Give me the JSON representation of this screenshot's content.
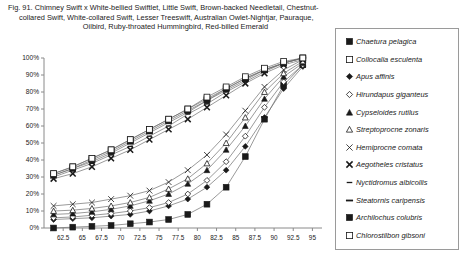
{
  "caption": {
    "line1": "Fig. 91.  Chimney Swift x White-bellied Swiftlet, Little Swift, Brown-backed Needletail, Chestnut-",
    "line2": "collared Swift, White-collared Swift, Lesser Treeswift, Australian Owlet-Nightjar, Pauraque,",
    "line3": "Oilbird, Ruby-throated Hummingbird, Red-billed Emerald"
  },
  "chart_data": {
    "type": "line",
    "xlabel": "",
    "ylabel": "",
    "grid": false,
    "legend_position": "right",
    "xlim": [
      60,
      96.25
    ],
    "ylim": [
      0,
      100
    ],
    "xticks": [
      62.5,
      65,
      67.5,
      70,
      72.5,
      75,
      77.5,
      80,
      82.5,
      85,
      87.5,
      90,
      92.5,
      95
    ],
    "xticklabels": [
      "62.5",
      "65",
      "67.5",
      "70",
      "72.5",
      "75",
      "77.5",
      "80",
      "82.5",
      "85",
      "87.5",
      "90",
      "92.5",
      "95"
    ],
    "yticks": [
      0,
      10,
      20,
      30,
      40,
      50,
      60,
      70,
      80,
      90,
      100
    ],
    "yticklabels": [
      "0%",
      "10%",
      "20%",
      "30%",
      "40%",
      "50%",
      "60%",
      "70%",
      "80%",
      "90%",
      "100%"
    ],
    "x": [
      61.25,
      63.75,
      66.25,
      68.75,
      71.25,
      73.75,
      76.25,
      78.75,
      81.25,
      83.75,
      86.25,
      88.75,
      91.25,
      93.75
    ],
    "series": [
      {
        "name": "Chaetura pelagica",
        "marker": "filled-square",
        "values": [
          0,
          0.5,
          1,
          1.5,
          2.5,
          3.5,
          5,
          8,
          14,
          24,
          42,
          64,
          84,
          96
        ]
      },
      {
        "name": "Collocalia esculenta",
        "marker": "open-square",
        "values": [
          32,
          36,
          41,
          46,
          52,
          58,
          64,
          70,
          76,
          82,
          88,
          93,
          97,
          100
        ]
      },
      {
        "name": "Apus affinis",
        "marker": "filled-diamond",
        "values": [
          5,
          5.5,
          6,
          7,
          8,
          10,
          13,
          17,
          24,
          34,
          48,
          65,
          82,
          95
        ]
      },
      {
        "name": "Hirundapus giganteus",
        "marker": "open-diamond",
        "values": [
          6,
          6.5,
          7.5,
          8.5,
          10,
          12,
          15,
          20,
          28,
          39,
          54,
          71,
          86,
          96
        ]
      },
      {
        "name": "Cypseloides rutilus",
        "marker": "filled-triangle",
        "values": [
          8,
          8.5,
          9.5,
          11,
          13,
          16,
          20,
          26,
          34,
          46,
          60,
          76,
          89,
          97
        ]
      },
      {
        "name": "Streptoprocne zonaris",
        "marker": "open-triangle",
        "values": [
          10,
          10.5,
          11.5,
          13,
          15,
          18,
          23,
          29,
          38,
          50,
          65,
          80,
          91,
          98
        ]
      },
      {
        "name": "Hemiprocne comata",
        "marker": "x-thin",
        "values": [
          13,
          14,
          15,
          17,
          19,
          22,
          27,
          34,
          43,
          55,
          69,
          83,
          93,
          99
        ]
      },
      {
        "name": "Aegotheles cristatus",
        "marker": "x-bold",
        "values": [
          29,
          32,
          36,
          41,
          46,
          52,
          58,
          64,
          71,
          78,
          85,
          91,
          96,
          99
        ]
      },
      {
        "name": "Nyctidromus albicollis",
        "marker": "dash-small",
        "values": [
          30,
          34,
          38,
          43,
          48,
          54,
          60,
          67,
          73,
          80,
          86,
          92,
          97,
          100
        ]
      },
      {
        "name": "Steatornis caripensis",
        "marker": "dash-wide",
        "values": [
          31,
          35,
          39,
          44,
          50,
          56,
          62,
          68,
          75,
          81,
          87,
          93,
          97,
          100
        ]
      },
      {
        "name": "Archilochus colubris",
        "marker": "filled-square-2",
        "values": [
          31,
          35,
          40,
          45,
          51,
          57,
          63,
          69,
          75,
          82,
          88,
          93,
          97,
          100
        ]
      },
      {
        "name": "Chlorostilbon gibsoni",
        "marker": "open-square-2",
        "values": [
          32,
          36,
          41,
          46,
          52,
          58,
          64,
          70,
          77,
          83,
          89,
          94,
          98,
          100
        ]
      }
    ]
  },
  "legend": {
    "items": [
      {
        "label": "Chaetura pelagica",
        "marker": "filled-square"
      },
      {
        "label": "Collocalia esculenta",
        "marker": "open-square"
      },
      {
        "label": "Apus affinis",
        "marker": "filled-diamond"
      },
      {
        "label": "Hirundapus giganteus",
        "marker": "open-diamond"
      },
      {
        "label": "Cypseloides rutilus",
        "marker": "filled-triangle"
      },
      {
        "label": "Streptoprocne zonaris",
        "marker": "open-triangle"
      },
      {
        "label": "Hemiprocne comata",
        "marker": "x-thin"
      },
      {
        "label": "Aegotheles cristatus",
        "marker": "x-bold"
      },
      {
        "label": "Nyctidromus albicollis",
        "marker": "dash-small"
      },
      {
        "label": "Steatornis caripensis",
        "marker": "dash-wide"
      },
      {
        "label": "Archilochus colubris",
        "marker": "filled-square-2"
      },
      {
        "label": "Chlorostilbon gibsoni",
        "marker": "open-square-2"
      }
    ]
  },
  "colors": {
    "ink": "#1a1a1a",
    "axis": "#8a8a8a",
    "line": "#6e6e6e",
    "background": "#ffffff"
  }
}
